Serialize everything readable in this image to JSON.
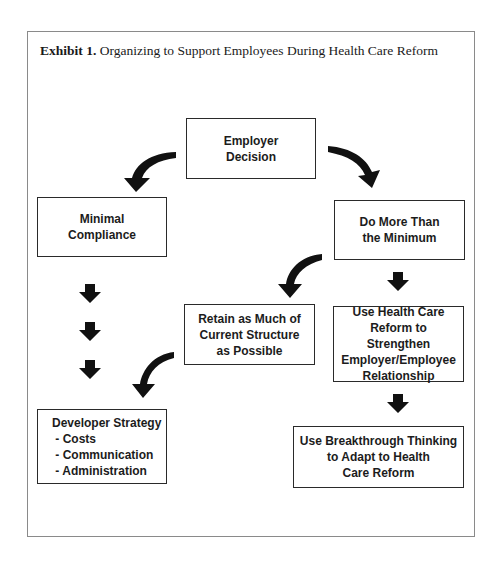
{
  "caption": {
    "label": "Exhibit 1.",
    "title": "Organizing to Support Employees During Health Care Reform"
  },
  "nodes": {
    "employer_decision": {
      "lines": [
        "Employer",
        "Decision"
      ]
    },
    "minimal_compliance": {
      "lines": [
        "Minimal",
        "Compliance"
      ]
    },
    "do_more": {
      "lines": [
        "Do More Than",
        "the Minimum"
      ]
    },
    "retain": {
      "lines": [
        "Retain as Much of",
        "Current Structure",
        "as Possible"
      ]
    },
    "use_reform": {
      "lines": [
        "Use Health Care",
        "Reform to Strengthen",
        "Employer/Employee",
        "Relationship"
      ]
    },
    "developer_strategy": {
      "lines": [
        "Developer Strategy",
        " - Costs",
        " - Communication",
        " - Administration"
      ]
    },
    "breakthrough": {
      "lines": [
        "Use Breakthrough Thinking",
        "to Adapt to Health",
        "Care Reform"
      ]
    }
  },
  "edges": [
    {
      "from": "employer_decision",
      "to": "minimal_compliance",
      "style": "curved"
    },
    {
      "from": "employer_decision",
      "to": "do_more",
      "style": "curved"
    },
    {
      "from": "do_more",
      "to": "retain",
      "style": "curved"
    },
    {
      "from": "do_more",
      "to": "use_reform",
      "style": "block"
    },
    {
      "from": "minimal_compliance",
      "to": "developer_strategy",
      "style": "block-triple"
    },
    {
      "from": "retain",
      "to": "developer_strategy",
      "style": "curved"
    },
    {
      "from": "use_reform",
      "to": "breakthrough",
      "style": "block"
    }
  ]
}
